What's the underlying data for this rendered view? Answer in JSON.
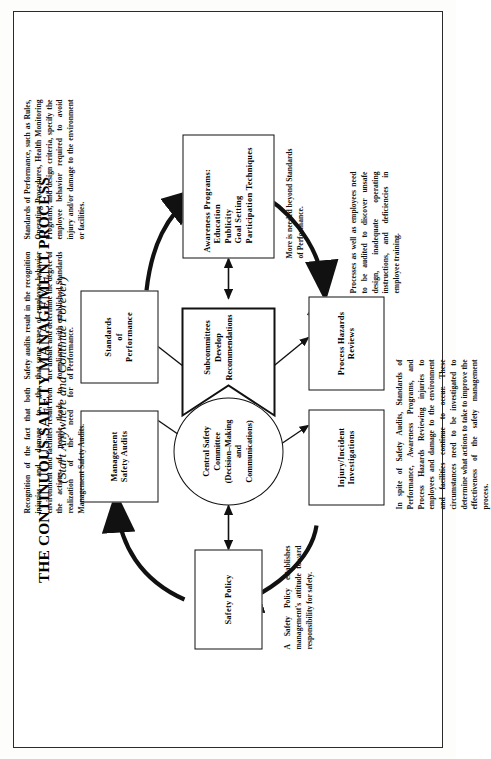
{
  "document": {
    "title_main": "THE CONTINUOUS SAFETY MANAGEMENT PROCESS",
    "title_sub": "(Start Anywhere and Continue Forever)"
  },
  "nodes": {
    "safety_policy": {
      "line1": "Safety  Policy"
    },
    "management_safety_audits": {
      "line1": "Management",
      "line2": "Safety Audits"
    },
    "standards_of_performance": {
      "line1": "Standards",
      "line2": "of",
      "line3": "Performance"
    },
    "central_safety_committee": {
      "line1": "Central Safety",
      "line2": "Committee",
      "line3": "(Decision–Making",
      "line4": "and",
      "line5": "Communications)"
    },
    "subcommittees": {
      "line1": "Subcommittees",
      "line2": "Develop",
      "line3": "Recommendations"
    },
    "awareness_programs": {
      "line1": "Awareness  Programs:",
      "line2": "Education",
      "line3": "Publicity",
      "line4": "Goal Setting",
      "line5": "Participation Techniques"
    },
    "injury_incident_investigations": {
      "line1": "Injury/Incident",
      "line2": "Investigations"
    },
    "process_hazards_reviews": {
      "line1": "Process  Hazards",
      "line2": "Reviews"
    }
  },
  "notes": {
    "safety_policy_note": "A Safety Policy establishes management's attitude toward responsibility for safety.",
    "management_audits_note": "Recognition of the fact that both injuries and damage to the environment and facilities result from the actions of people leads to realization of the need for Management Safety Audits.",
    "standards_note_left": "Safety audits result in the recognition that some types of employee behavior are unsafe and determine the degree of compliance with established Standards of Performance.",
    "standards_note_right": "Standards of Performance, such as Rules, Operating Procedures, Health Monitoring Programs, and design criteria, specify the employee behavior required to avoid injury and/or damage to the environment or facilities.",
    "awareness_note": "More is needed beyond Standards of Performance.",
    "process_hazards_note": "Processes as well as employees need to be audited to discover unsafe design, inadequate operating instructions, and deficiencies in employee training.",
    "injury_note": "In spite of Safety Audits, Standards of Performance, Awareness Programs, and Process Hazards Reviewing injuries to employees and damage to the environment and facilities continue to occur. These circumstances need to be investigated to determine what actions to take to improve the effectiveness of the safety management process."
  }
}
